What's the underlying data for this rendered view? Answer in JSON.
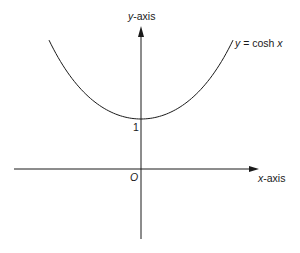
{
  "diagram": {
    "y_axis_label_var": "y",
    "y_axis_label_rest": "-axis",
    "x_axis_label_var": "x",
    "x_axis_label_rest": "-axis",
    "origin_label": "O",
    "intercept_label": "1",
    "curve_label_y": "y",
    "curve_label_eq": " = cosh ",
    "curve_label_x": "x",
    "colors": {
      "ink": "#1a1a1a",
      "background": "#ffffff"
    }
  },
  "chart_data": {
    "type": "line",
    "title": "y = cosh x",
    "xlabel": "x-axis",
    "ylabel": "y-axis",
    "series": [
      {
        "name": "y = cosh x",
        "x": [
          -1.6,
          -1.2,
          -0.8,
          -0.4,
          0,
          0.4,
          0.8,
          1.2,
          1.6
        ],
        "values": [
          2.58,
          1.81,
          1.34,
          1.08,
          1.0,
          1.08,
          1.34,
          1.81,
          2.58
        ]
      }
    ],
    "annotations": [
      "O",
      "1"
    ],
    "grid": false
  }
}
